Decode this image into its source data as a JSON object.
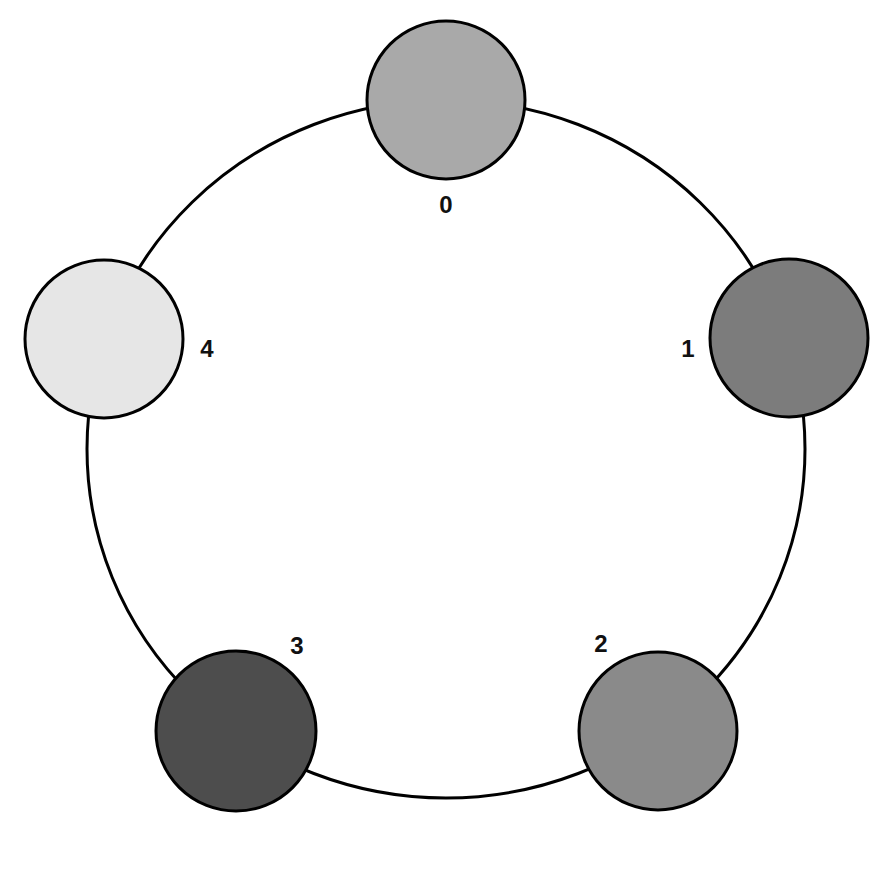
{
  "diagram": {
    "type": "ring",
    "ring": {
      "cx": 446,
      "cy": 449,
      "rx": 359,
      "ry": 349,
      "stroke": "#000000",
      "stroke_width": 3
    },
    "nodes": [
      {
        "id": "0",
        "label": "0",
        "cx": 446,
        "cy": 100,
        "r": 79,
        "fill": "#a9a9a9",
        "label_x": 446,
        "label_y": 213
      },
      {
        "id": "1",
        "label": "1",
        "cx": 789,
        "cy": 338,
        "r": 79,
        "fill": "#7c7c7c",
        "label_x": 688,
        "label_y": 357
      },
      {
        "id": "2",
        "label": "2",
        "cx": 658,
        "cy": 731,
        "r": 79,
        "fill": "#8a8a8a",
        "label_x": 601,
        "label_y": 652
      },
      {
        "id": "3",
        "label": "3",
        "cx": 236,
        "cy": 731,
        "r": 80,
        "fill": "#4d4d4d",
        "label_x": 297,
        "label_y": 654
      },
      {
        "id": "4",
        "label": "4",
        "cx": 104,
        "cy": 339,
        "r": 79,
        "fill": "#e6e6e6",
        "label_x": 207,
        "label_y": 357
      }
    ]
  }
}
